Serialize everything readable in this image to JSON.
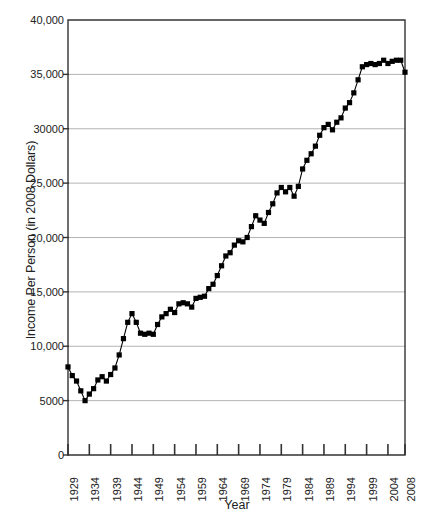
{
  "chart_data": {
    "type": "line",
    "title": "",
    "xlabel": "Year",
    "ylabel": "Income Per Person (in 2008 Dollars)",
    "xlim": [
      1929,
      2008
    ],
    "ylim": [
      0,
      40000
    ],
    "grid": true,
    "legend": null,
    "marker": "filled-square",
    "line_color": "#000000",
    "marker_color": "#000000",
    "grid_color": "#b4b4b4",
    "axis_color": "#333333",
    "background_color": "#ffffff",
    "y_ticks": [
      0,
      5000,
      10000,
      15000,
      20000,
      25000,
      30000,
      35000,
      40000
    ],
    "y_tick_labels": [
      "0",
      "5000",
      "10,000",
      "15,000",
      "20,000",
      "25,000",
      "30000",
      "35,000",
      "40,000"
    ],
    "x_ticks": [
      1929,
      1934,
      1939,
      1944,
      1949,
      1954,
      1959,
      1964,
      1969,
      1974,
      1979,
      1984,
      1989,
      1994,
      1999,
      2004,
      2008
    ],
    "x_tick_labels": [
      "1929",
      "1934",
      "1939",
      "1944",
      "1949",
      "1954",
      "1959",
      "1964",
      "1969",
      "1974",
      "1979",
      "1984",
      "1989",
      "1994",
      "1999",
      "2004",
      "2008"
    ],
    "x": [
      1929,
      1930,
      1931,
      1932,
      1933,
      1934,
      1935,
      1936,
      1937,
      1938,
      1939,
      1940,
      1941,
      1942,
      1943,
      1944,
      1945,
      1946,
      1947,
      1948,
      1949,
      1950,
      1951,
      1952,
      1953,
      1954,
      1955,
      1956,
      1957,
      1958,
      1959,
      1960,
      1961,
      1962,
      1963,
      1964,
      1965,
      1966,
      1967,
      1968,
      1969,
      1970,
      1971,
      1972,
      1973,
      1974,
      1975,
      1976,
      1977,
      1978,
      1979,
      1980,
      1981,
      1982,
      1983,
      1984,
      1985,
      1986,
      1987,
      1988,
      1989,
      1990,
      1991,
      1992,
      1993,
      1994,
      1995,
      1996,
      1997,
      1998,
      1999,
      2000,
      2001,
      2002,
      2003,
      2004,
      2005,
      2006,
      2007,
      2008
    ],
    "y": [
      8100,
      7300,
      6800,
      5900,
      5000,
      5600,
      6100,
      6900,
      7200,
      6800,
      7400,
      8000,
      9200,
      10700,
      12200,
      13000,
      12200,
      11200,
      11100,
      11200,
      11100,
      12000,
      12700,
      13000,
      13400,
      13100,
      13900,
      14000,
      13900,
      13600,
      14400,
      14500,
      14600,
      15300,
      15700,
      16500,
      17400,
      18300,
      18600,
      19300,
      19700,
      19600,
      20000,
      21000,
      22000,
      21600,
      21300,
      22300,
      23100,
      24100,
      24600,
      24200,
      24600,
      23800,
      24700,
      26300,
      27100,
      27700,
      28400,
      29400,
      30100,
      30400,
      29900,
      30600,
      31000,
      31900,
      32400,
      33300,
      34500,
      35700,
      35900,
      36000,
      35900,
      36000,
      36300,
      36000,
      36200,
      36300,
      36300,
      35200
    ],
    "series": [
      {
        "name": "Income Per Person (in 2008 Dollars)",
        "values": [
          8100,
          7300,
          6800,
          5900,
          5000,
          5600,
          6100,
          6900,
          7200,
          6800,
          7400,
          8000,
          9200,
          10700,
          12200,
          13000,
          12200,
          11200,
          11100,
          11200,
          11100,
          12000,
          12700,
          13000,
          13400,
          13100,
          13900,
          14000,
          13900,
          13600,
          14400,
          14500,
          14600,
          15300,
          15700,
          16500,
          17400,
          18300,
          18600,
          19300,
          19700,
          19600,
          20000,
          21000,
          22000,
          21600,
          21300,
          22300,
          23100,
          24100,
          24600,
          24200,
          24600,
          23800,
          24700,
          26300,
          27100,
          27700,
          28400,
          29400,
          30100,
          30400,
          29900,
          30600,
          31000,
          31900,
          32400,
          33300,
          34500,
          35700,
          35900,
          36000,
          35900,
          36000,
          36300,
          36000,
          36200,
          36300,
          36300,
          35200
        ]
      }
    ]
  }
}
